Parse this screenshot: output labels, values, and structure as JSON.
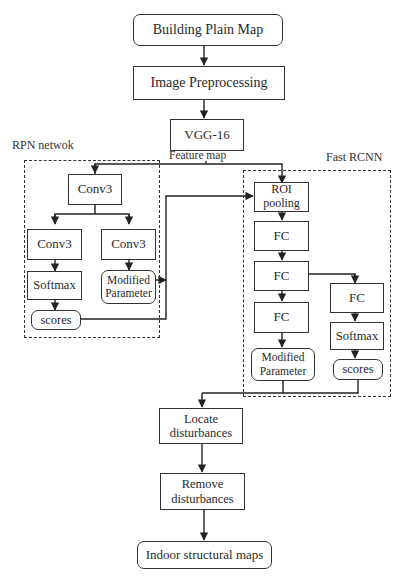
{
  "diagram": {
    "type": "flowchart",
    "title": "",
    "nodes": {
      "building_plain_map": "Building Plain Map",
      "image_preprocessing": "Image Preprocessing",
      "vgg16": "VGG-16",
      "feature_map_label": "Feature map",
      "rpn": {
        "group_label": "RPN netwok",
        "conv3_top": "Conv3",
        "conv3_left": "Conv3",
        "conv3_right": "Conv3",
        "softmax": "Softmax",
        "modified_parameter": "Modified Parameter",
        "scores": "scores"
      },
      "fast_rcnn": {
        "group_label": "Fast RCNN",
        "roi_pooling": "ROI pooling",
        "fc1": "FC",
        "fc2": "FC",
        "fc3": "FC",
        "fc_branch": "FC",
        "softmax": "Softmax",
        "modified_parameter": "Modified Parameter",
        "scores": "scores"
      },
      "locate_disturbances": "Locate disturbances",
      "remove_disturbances": "Remove disturbances",
      "indoor_structural_maps": "Indoor structural maps"
    },
    "edges": [
      [
        "Building Plain Map",
        "Image Preprocessing"
      ],
      [
        "Image Preprocessing",
        "VGG-16"
      ],
      [
        "VGG-16 (Feature map)",
        "RPN Conv3"
      ],
      [
        "VGG-16 (Feature map)",
        "ROI pooling"
      ],
      [
        "RPN Conv3",
        "Conv3 (left)"
      ],
      [
        "RPN Conv3",
        "Conv3 (right)"
      ],
      [
        "Conv3 (left)",
        "Softmax"
      ],
      [
        "Softmax",
        "scores"
      ],
      [
        "Conv3 (right)",
        "Modified Parameter"
      ],
      [
        "scores (RPN)",
        "ROI pooling"
      ],
      [
        "ROI pooling",
        "FC"
      ],
      [
        "FC",
        "FC"
      ],
      [
        "FC",
        "FC"
      ],
      [
        "FC",
        "FC (branch)"
      ],
      [
        "FC (branch)",
        "Softmax"
      ],
      [
        "Softmax",
        "scores"
      ],
      [
        "FC",
        "Modified Parameter"
      ],
      [
        "Modified Parameter (Fast RCNN)",
        "Locate disturbances"
      ],
      [
        "scores (Fast RCNN)",
        "Locate disturbances"
      ],
      [
        "Locate disturbances",
        "Remove disturbances"
      ],
      [
        "Remove disturbances",
        "Indoor structural maps"
      ]
    ]
  }
}
